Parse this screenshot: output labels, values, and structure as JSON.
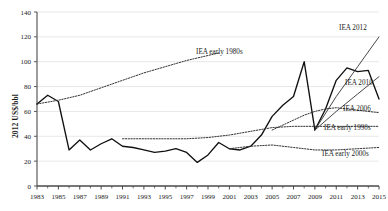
{
  "chart_data": {
    "type": "line",
    "title": "",
    "xlabel": "",
    "ylabel": "2012 US$/bbl",
    "xlim": [
      1983,
      2015
    ],
    "ylim": [
      0,
      140
    ],
    "yticks": [
      0,
      20,
      40,
      60,
      80,
      100,
      120,
      140
    ],
    "xticks": [
      1983,
      1985,
      1987,
      1989,
      1991,
      1993,
      1995,
      1997,
      1999,
      2001,
      2003,
      2005,
      2007,
      2009,
      2011,
      2013,
      2015
    ],
    "xticks_minor": [
      1984,
      1986,
      1988,
      1990,
      1992,
      1994,
      1996,
      1998,
      2000,
      2002,
      2004,
      2006,
      2008,
      2010,
      2012,
      2014
    ],
    "grid": "horizontal",
    "legend_position": "inline-annotations",
    "series": [
      {
        "name": "Actual oil price",
        "style": "solid",
        "color": "#111111",
        "x": [
          1983,
          1984,
          1985,
          1986,
          1987,
          1988,
          1989,
          1990,
          1991,
          1992,
          1993,
          1994,
          1995,
          1996,
          1997,
          1998,
          1999,
          2000,
          2001,
          2002,
          2003,
          2004,
          2005,
          2006,
          2007,
          2008,
          2009,
          2010,
          2011,
          2012,
          2013,
          2014,
          2015
        ],
        "values": [
          66,
          73,
          68,
          29,
          37,
          29,
          34,
          38,
          32,
          31,
          29,
          27,
          28,
          30,
          27,
          19,
          25,
          35,
          30,
          29,
          32,
          41,
          56,
          65,
          72,
          100,
          45,
          62,
          85,
          95,
          92,
          93,
          70
        ]
      },
      {
        "name": "IEA early 1980s",
        "style": "dotted",
        "color": "#333333",
        "x": [
          1983,
          1985,
          1987,
          1989,
          1991,
          1993,
          1995,
          1997,
          1999,
          2000
        ],
        "values": [
          66,
          69,
          73,
          79,
          85,
          91,
          96,
          101,
          105,
          107
        ]
      },
      {
        "name": "IEA early 1990s",
        "style": "dotted",
        "color": "#333333",
        "x": [
          1991,
          1993,
          1995,
          1997,
          1999,
          2001,
          2003,
          2005,
          2007,
          2009,
          2011,
          2013,
          2015
        ],
        "values": [
          38,
          38,
          38,
          38,
          39,
          41,
          44,
          47,
          48,
          48,
          48,
          48,
          48
        ]
      },
      {
        "name": "IEA early 2000s",
        "style": "dotted",
        "color": "#333333",
        "x": [
          2001,
          2003,
          2005,
          2007,
          2009,
          2011,
          2013,
          2015
        ],
        "values": [
          30,
          32,
          33,
          31,
          29,
          29,
          30,
          31
        ]
      },
      {
        "name": "IEA 2006",
        "style": "dotted",
        "color": "#333333",
        "x": [
          2005,
          2006,
          2007,
          2008,
          2009,
          2010,
          2011,
          2012,
          2013,
          2014,
          2015
        ],
        "values": [
          45,
          49,
          53,
          57,
          60,
          62,
          63,
          62,
          61,
          60,
          59
        ]
      },
      {
        "name": "IEA 2010",
        "style": "solid-thin",
        "color": "#333333",
        "x": [
          2009,
          2011,
          2013,
          2015
        ],
        "values": [
          45,
          60,
          74,
          88
        ]
      },
      {
        "name": "IEA 2012",
        "style": "solid-thin",
        "color": "#333333",
        "x": [
          2009,
          2011,
          2013,
          2015
        ],
        "values": [
          45,
          72,
          96,
          120
        ]
      }
    ],
    "annotations": [
      {
        "label": "IEA early 1980s",
        "x_px": 196,
        "y_px": 54
      },
      {
        "label": "IEA 2012",
        "x_px": 339,
        "y_px": 30
      },
      {
        "label": "IEA 2010",
        "x_px": 345,
        "y_px": 85
      },
      {
        "label": "IEA 2006",
        "x_px": 343,
        "y_px": 111
      },
      {
        "label": "IEA early 1990s",
        "x_px": 324,
        "y_px": 130
      },
      {
        "label": "IEA early 2000s",
        "x_px": 322,
        "y_px": 156
      }
    ]
  }
}
